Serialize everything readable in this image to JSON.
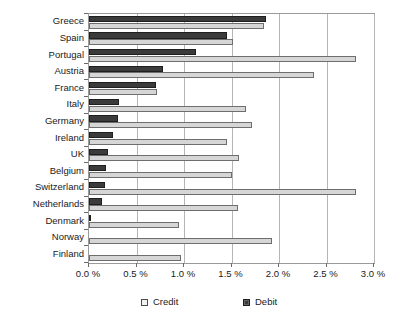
{
  "chart_data": {
    "type": "bar",
    "orientation": "horizontal",
    "title": "",
    "xlabel": "",
    "ylabel": "",
    "xlim": [
      0,
      3.0
    ],
    "xticks": [
      0.0,
      0.5,
      1.0,
      1.5,
      2.0,
      2.5,
      3.0
    ],
    "xticklabels": [
      "0.0 %",
      "0.5 %",
      "1.0 %",
      "1.5 %",
      "2.0 %",
      "2.5 %",
      "3.0 %"
    ],
    "grid": true,
    "legend_position": "bottom",
    "categories": [
      "Greece",
      "Spain",
      "Portugal",
      "Austria",
      "France",
      "Italy",
      "Germany",
      "Ireland",
      "UK",
      "Belgium",
      "Switzerland",
      "Netherlands",
      "Denmark",
      "Norway",
      "Finland"
    ],
    "series": [
      {
        "name": "Credit",
        "color": "#d6d6d6",
        "values": [
          1.84,
          1.52,
          2.81,
          2.37,
          0.72,
          1.65,
          1.72,
          1.45,
          1.58,
          1.5,
          2.81,
          1.57,
          0.95,
          1.93,
          0.97
        ]
      },
      {
        "name": "Debit",
        "color": "#3b3b3b",
        "values": [
          1.86,
          1.45,
          1.13,
          0.78,
          0.7,
          0.32,
          0.31,
          0.25,
          0.2,
          0.18,
          0.17,
          0.14,
          0.02,
          0.0,
          0.0
        ]
      }
    ]
  },
  "legend": {
    "items": [
      {
        "label": "Credit",
        "swatch": "credit-swatch-icon"
      },
      {
        "label": "Debit",
        "swatch": "debit-swatch-icon"
      }
    ]
  },
  "colors": {
    "credit": "#d6d6d6",
    "debit": "#3b3b3b",
    "grid": "#b5b5b5",
    "frame": "#9a9a9a",
    "text": "#1a1a1a",
    "background": "#ffffff"
  }
}
